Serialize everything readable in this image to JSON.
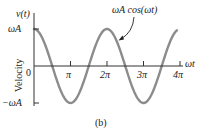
{
  "chart_data": {
    "type": "line",
    "title": "",
    "xlabel": "ωt",
    "ylabel": "Velocity",
    "y_axis_function_label": "v(t)",
    "x_ticks": [
      {
        "value": 0,
        "label": "0"
      },
      {
        "value": 3.14159,
        "label": "π"
      },
      {
        "value": 6.28318,
        "label": "2π"
      },
      {
        "value": 9.42478,
        "label": "3π"
      },
      {
        "value": 12.56637,
        "label": "4π"
      }
    ],
    "y_ticks": [
      {
        "value": 1,
        "label": "ωA"
      },
      {
        "value": 0,
        "label": "0"
      },
      {
        "value": -1,
        "label": "−ωA"
      }
    ],
    "series": [
      {
        "name": "ωA cos(ωt)",
        "function": "cos",
        "amplitude_label": "ωA",
        "x_range": [
          0,
          12.3
        ],
        "color": "#8c8c8c"
      }
    ],
    "annotations": [
      {
        "text": "ωA cos(ωt)",
        "arrow_to": "curve near 2π"
      }
    ],
    "ylim": [
      -1.05,
      1.4
    ],
    "xlim": [
      0,
      13.5
    ],
    "grid": false,
    "legend": "none",
    "caption": "(b)"
  },
  "colors": {
    "curve": "#8c8c8c",
    "axis": "#333333",
    "text": "#222222"
  }
}
